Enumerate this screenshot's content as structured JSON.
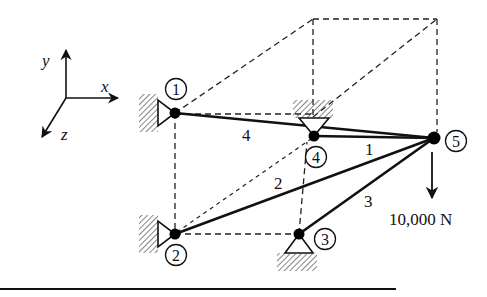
{
  "diagram": {
    "type": "3D truss",
    "axes": {
      "x": "x",
      "y": "y",
      "z": "z"
    },
    "nodes": [
      {
        "id": "1",
        "label": "1",
        "x": 175,
        "y": 113,
        "support": "pin-wall"
      },
      {
        "id": "2",
        "label": "2",
        "x": 175,
        "y": 234,
        "support": "pin-wall"
      },
      {
        "id": "3",
        "label": "3",
        "x": 299,
        "y": 234,
        "support": "pin-ground"
      },
      {
        "id": "4",
        "label": "4",
        "x": 314,
        "y": 136,
        "support": "pin-ceiling"
      },
      {
        "id": "5",
        "label": "5",
        "x": 434,
        "y": 138,
        "support": "free"
      }
    ],
    "members": [
      {
        "label": "1",
        "from": "4",
        "to": "5"
      },
      {
        "label": "2",
        "from": "2",
        "to": "5"
      },
      {
        "label": "3",
        "from": "3",
        "to": "5"
      },
      {
        "label": "4",
        "from": "1",
        "to": "5"
      }
    ],
    "load": {
      "node": "5",
      "direction": "down",
      "label": "10,000 N"
    }
  }
}
